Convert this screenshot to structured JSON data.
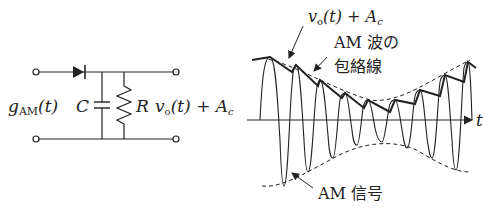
{
  "circuit": {
    "input_label_main": "g",
    "input_label_sub": "AM",
    "input_label_arg": "(t)",
    "capacitor_label": "C",
    "resistor_label": "R",
    "output_label_main": "v",
    "output_label_sub": "o",
    "output_label_rest": "(t) + A",
    "output_label_sub2": "c"
  },
  "waveform": {
    "envelope_detector_label_main": "v",
    "envelope_detector_label_sub": "o",
    "envelope_detector_label_rest": "(t) + A",
    "envelope_detector_label_sub2": "c",
    "envelope_label_line1": "AM 波の",
    "envelope_label_line2": "包絡線",
    "signal_label": "AM 信号",
    "axis_label": "t"
  },
  "colors": {
    "stroke": "#222222",
    "background": "#ffffff"
  }
}
